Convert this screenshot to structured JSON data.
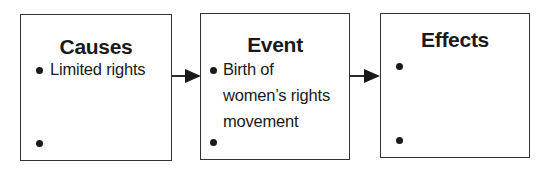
{
  "diagram": {
    "type": "cause-effect flow chart",
    "boxes": [
      {
        "title": "Causes",
        "bullets": [
          "Limited rights",
          ""
        ]
      },
      {
        "title": "Event",
        "bullets": [
          "Birth of women’s rights movement",
          ""
        ],
        "bullet_lines": [
          "Birth of",
          "women’s rights",
          "movement"
        ]
      },
      {
        "title": "Effects",
        "bullets": [
          "",
          ""
        ]
      }
    ],
    "arrows": [
      {
        "from": "Causes",
        "to": "Event"
      },
      {
        "from": "Event",
        "to": "Effects"
      }
    ],
    "colors": {
      "border": "#333333",
      "text": "#1a1a1a",
      "background": "#ffffff"
    }
  }
}
